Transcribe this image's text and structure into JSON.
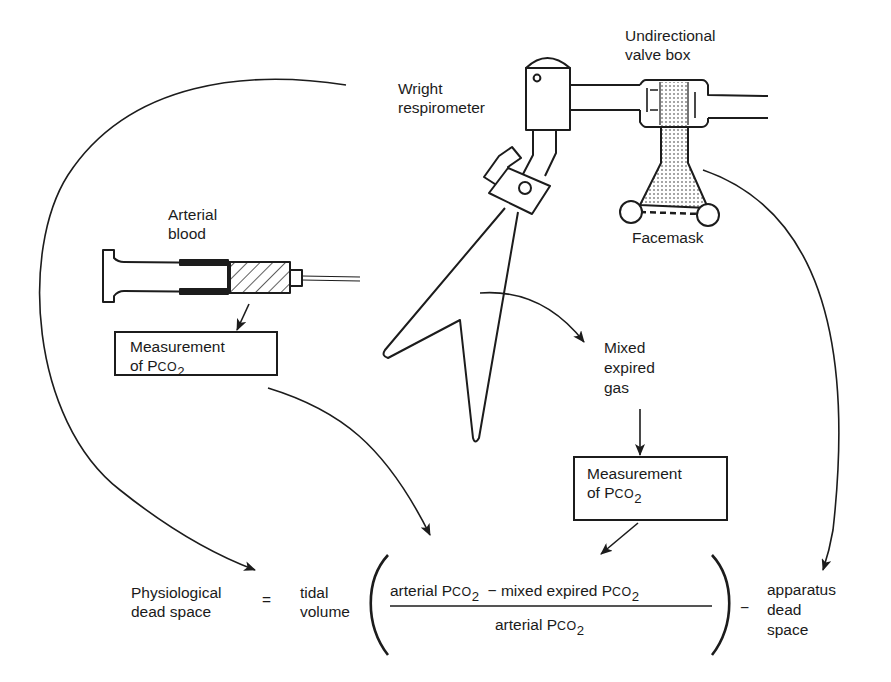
{
  "labels": {
    "wright_respirometer": [
      "Wright",
      "respirometer"
    ],
    "valve_box": [
      "Undirectional",
      "valve box"
    ],
    "facemask": "Facemask",
    "arterial_blood": [
      "Arterial",
      "blood"
    ],
    "mixed_expired_gas": [
      "Mixed",
      "expired",
      "gas"
    ]
  },
  "boxes": {
    "arterial_measurement": {
      "line1": "Measurement",
      "line2_prefix": "of P",
      "line2_co": "CO",
      "line2_sub": "2"
    },
    "gas_measurement": {
      "line1": "Measurement",
      "line2_prefix": "of P",
      "line2_co": "CO",
      "line2_sub": "2"
    }
  },
  "equation": {
    "lhs": [
      "Physiological",
      "dead space"
    ],
    "equals": "=",
    "multiplier": [
      "tidal",
      "volume"
    ],
    "numerator": {
      "term1_prefix": "arterial P",
      "term1_co": "CO",
      "term1_sub": "2",
      "minus": "−",
      "term2_prefix": "mixed expired P",
      "term2_co": "CO",
      "term2_sub": "2"
    },
    "denominator": {
      "prefix": "arterial P",
      "co": "CO",
      "sub": "2"
    },
    "minus": "−",
    "subtrahend": [
      "apparatus",
      "dead",
      "space"
    ]
  }
}
